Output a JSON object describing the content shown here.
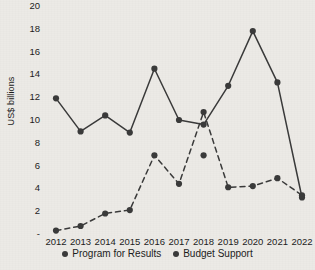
{
  "chart_data": {
    "type": "line",
    "title": "",
    "xlabel": "",
    "ylabel": "US$ billions",
    "categories": [
      "2012",
      "2013",
      "2014",
      "2015",
      "2016",
      "2017",
      "2018",
      "2019",
      "2020",
      "2021",
      "2022"
    ],
    "ylim": [
      0,
      20
    ],
    "ytick_labels": [
      "20",
      "18",
      "16",
      "14",
      "12",
      "10",
      "8",
      "6",
      "4",
      "2",
      "-"
    ],
    "ytick_values": [
      20,
      18,
      16,
      14,
      12,
      10,
      8,
      6,
      4,
      2,
      0
    ],
    "grid": false,
    "legend_position": "bottom",
    "series": [
      {
        "name": "Program for Results",
        "style": "solid",
        "color": "#3a3a3a",
        "values": [
          11.9,
          9.0,
          10.4,
          8.9,
          14.5,
          10.0,
          9.6,
          13.0,
          17.8,
          13.3,
          3.2
        ]
      },
      {
        "name": "Budget Support",
        "style": "dashed",
        "color": "#3a3a3a",
        "values": [
          0.3,
          0.7,
          1.8,
          2.1,
          6.9,
          4.4,
          10.7,
          4.1,
          4.2,
          4.9,
          3.4
        ]
      }
    ],
    "extra_points": [
      {
        "series": "Budget Support",
        "category": "2018",
        "value": 6.9,
        "note": "secondary-marker"
      }
    ]
  },
  "legend": {
    "items": [
      {
        "label": "Program for Results"
      },
      {
        "label": "Budget Support"
      }
    ]
  }
}
